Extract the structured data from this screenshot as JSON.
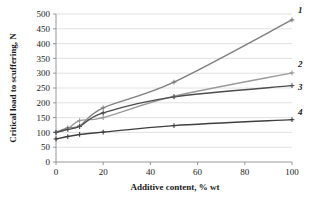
{
  "chart_data": {
    "type": "line",
    "title": "",
    "xlabel": "Additive content,  % wt",
    "ylabel": "Critical load to scuffering, N",
    "xlim": [
      0,
      100
    ],
    "ylim": [
      0,
      500
    ],
    "xticks": [
      "0",
      "20",
      "40",
      "60",
      "80",
      "100"
    ],
    "xtick_values": [
      0,
      20,
      40,
      60,
      80,
      100
    ],
    "yticks": [
      "0",
      "50",
      "100",
      "150",
      "200",
      "250",
      "300",
      "350",
      "400",
      "450",
      "500"
    ],
    "ytick_values": [
      0,
      50,
      100,
      150,
      200,
      250,
      300,
      350,
      400,
      450,
      500
    ],
    "grid": "horizontal",
    "legend_position": "line-end-labels",
    "x": [
      0,
      5,
      10,
      20,
      50,
      100
    ],
    "series": [
      {
        "name": "1",
        "label": "1",
        "color": "#7f7f7f",
        "marker": "plus",
        "values": [
          100,
          115,
          122,
          183,
          270,
          480
        ]
      },
      {
        "name": "2",
        "label": "2",
        "color": "#9a9a9a",
        "marker": "plus",
        "values": [
          100,
          112,
          140,
          150,
          222,
          301
        ]
      },
      {
        "name": "3",
        "label": "3",
        "color": "#4d4d4d",
        "marker": "plus",
        "values": [
          100,
          110,
          120,
          166,
          220,
          258
        ]
      },
      {
        "name": "4",
        "label": "4",
        "color": "#3f3f3f",
        "marker": "plus",
        "values": [
          78,
          86,
          93,
          101,
          123,
          143
        ]
      }
    ]
  }
}
